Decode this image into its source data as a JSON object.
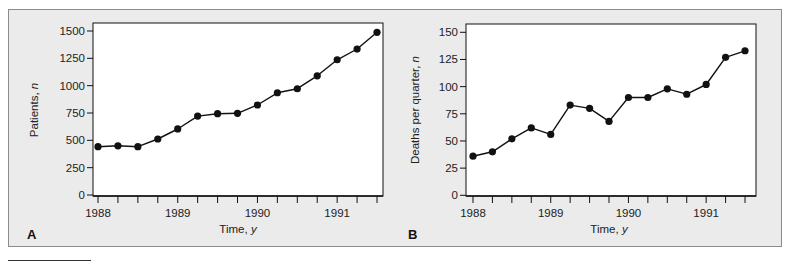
{
  "chart_data": [
    {
      "panel": "A",
      "type": "line",
      "title": "",
      "xlabel": "Time, y",
      "ylabel": "Patients, n",
      "ylim": [
        0,
        1500
      ],
      "yticks": [
        0,
        250,
        500,
        750,
        1000,
        1250,
        1500
      ],
      "xtick_labels": [
        "1988",
        "1989",
        "1990",
        "1991"
      ],
      "x_unit": "quarter",
      "x": [
        1988.0,
        1988.25,
        1988.5,
        1988.75,
        1989.0,
        1989.25,
        1989.5,
        1989.75,
        1990.0,
        1990.25,
        1990.5,
        1990.75,
        1991.0,
        1991.25,
        1991.5
      ],
      "values": [
        442,
        450,
        442,
        512,
        604,
        722,
        744,
        747,
        823,
        935,
        972,
        1090,
        1237,
        1335,
        1488
      ],
      "grid": false,
      "marker": "filled-circle",
      "color": "#111111"
    },
    {
      "panel": "B",
      "type": "line",
      "title": "",
      "xlabel": "Time, y",
      "ylabel": "Deaths per quarter, n",
      "ylim": [
        0,
        150
      ],
      "yticks": [
        0,
        25,
        50,
        75,
        100,
        125,
        150
      ],
      "xtick_labels": [
        "1988",
        "1989",
        "1990",
        "1991"
      ],
      "x_unit": "quarter",
      "x": [
        1988.0,
        1988.25,
        1988.5,
        1988.75,
        1989.0,
        1989.25,
        1989.5,
        1989.75,
        1990.0,
        1990.25,
        1990.5,
        1990.75,
        1991.0,
        1991.25,
        1991.5
      ],
      "values": [
        36,
        40,
        52,
        62,
        56,
        83,
        80,
        68,
        90,
        90,
        98,
        93,
        102,
        127,
        133
      ],
      "grid": false,
      "marker": "filled-circle",
      "color": "#111111"
    }
  ],
  "panels": {
    "a": {
      "letter": "A",
      "ylabel": "Patients, ",
      "ylabel_var": "n",
      "xlabel": "Time, ",
      "xlabel_var": "y"
    },
    "b": {
      "letter": "B",
      "ylabel": "Deaths per quarter, ",
      "ylabel_var": "n",
      "xlabel": "Time, ",
      "xlabel_var": "y"
    }
  },
  "colors": {
    "background": "#ebebeb",
    "plot_area": "#ffffff",
    "ink": "#111111",
    "frame": "#8c8c8c"
  }
}
